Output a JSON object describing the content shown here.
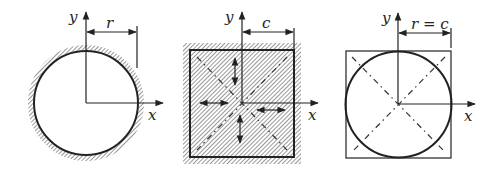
{
  "figure": {
    "panels": [
      {
        "id": "circle-cross-section",
        "shape": "circle",
        "boundary": "hatched (fixed wall)",
        "axis_labels": {
          "x": "x",
          "y": "y"
        },
        "dimension_label": "r"
      },
      {
        "id": "square-cross-section",
        "shape": "square",
        "boundary": "hatched (fixed wall)",
        "axis_labels": {
          "x": "x",
          "y": "y"
        },
        "dimension_label": "c",
        "features": [
          "dash-dot diagonals",
          "double-headed arrows"
        ]
      },
      {
        "id": "circle-inscribed-in-square",
        "shape": "circle inscribed in square",
        "axis_labels": {
          "x": "x",
          "y": "y"
        },
        "dimension_label": "r = c",
        "features": [
          "dash-dot diagonals"
        ]
      }
    ]
  },
  "colors": {
    "ink": "#222222",
    "background": "#ffffff"
  }
}
